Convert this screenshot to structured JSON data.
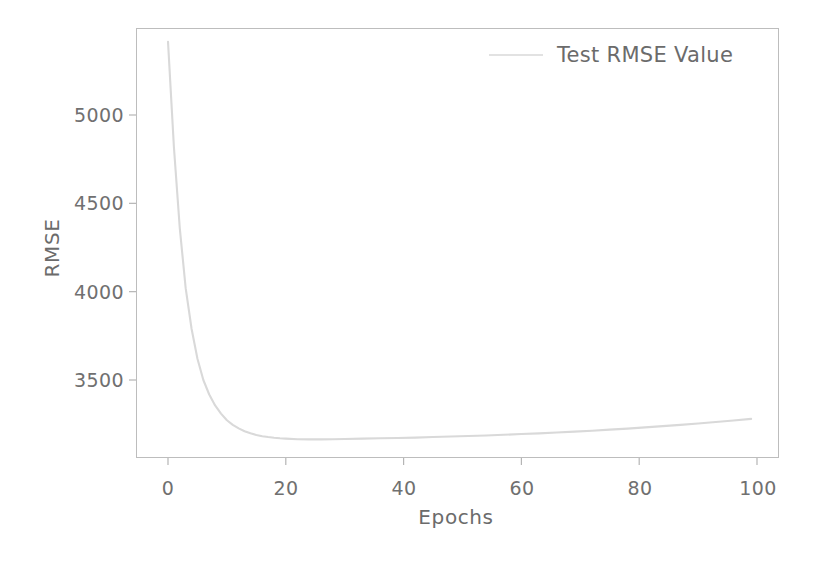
{
  "chart_data": {
    "type": "line",
    "title": "",
    "xlabel": "Epochs",
    "ylabel": "RMSE",
    "xlim": [
      -4,
      103
    ],
    "ylim": [
      3100,
      5500
    ],
    "xticks": [
      "0",
      "20",
      "40",
      "60",
      "80",
      "100"
    ],
    "xtick_values": [
      0,
      20,
      40,
      60,
      80,
      100
    ],
    "yticks": [
      "5000",
      "4500",
      "4000",
      "3500"
    ],
    "ytick_values": [
      5000,
      4500,
      4000,
      3500
    ],
    "grid": false,
    "legend_position": "top-right",
    "series": [
      {
        "name": "Test RMSE Value",
        "color": "#d9d9d9",
        "x": [
          0,
          1,
          2,
          3,
          4,
          5,
          6,
          7,
          8,
          9,
          10,
          11,
          12,
          13,
          14,
          15,
          16,
          17,
          18,
          19,
          20,
          22,
          24,
          26,
          28,
          30,
          33,
          36,
          39,
          42,
          45,
          48,
          51,
          54,
          57,
          60,
          63,
          66,
          69,
          72,
          75,
          78,
          81,
          84,
          87,
          90,
          93,
          96,
          99
        ],
        "values": [
          5415,
          4820,
          4360,
          4020,
          3790,
          3620,
          3500,
          3418,
          3356,
          3310,
          3272,
          3246,
          3226,
          3210,
          3198,
          3189,
          3182,
          3177,
          3173,
          3170,
          3168,
          3165,
          3164,
          3164,
          3165,
          3166,
          3168,
          3170,
          3172,
          3174,
          3177,
          3180,
          3183,
          3186,
          3190,
          3194,
          3198,
          3203,
          3208,
          3213,
          3219,
          3225,
          3232,
          3239,
          3246,
          3254,
          3262,
          3271,
          3280
        ]
      }
    ]
  },
  "legend": {
    "label": "Test RMSE Value"
  },
  "axes": {
    "x_title": "Epochs",
    "y_title": "RMSE"
  }
}
